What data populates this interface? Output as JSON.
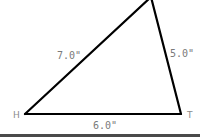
{
  "diagram": {
    "type": "triangle",
    "vertices": [
      {
        "label": "H"
      },
      {
        "label": "T"
      },
      {
        "label": ""
      }
    ],
    "sides": [
      {
        "name": "H-apex",
        "label": "7.0\""
      },
      {
        "name": "apex-T",
        "label": "5.0\""
      },
      {
        "name": "H-T",
        "label": "6.0\""
      }
    ],
    "colors": {
      "line": "#000000",
      "label": "#7a7a7a",
      "bottom_bar": "#4a4a4a"
    }
  }
}
